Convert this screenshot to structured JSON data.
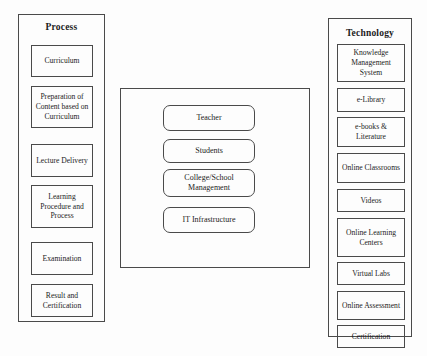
{
  "diagram": {
    "panels": [
      {
        "id": "process",
        "title": "Process",
        "items": [
          {
            "label": "Curriculum",
            "top": 44,
            "height": 32
          },
          {
            "label": "Preparation of Content based on Curriculum",
            "top": 85,
            "height": 42
          },
          {
            "label": "Lecture Delivery",
            "top": 143,
            "height": 33
          },
          {
            "label": "Learning Procedure and Process",
            "top": 184,
            "height": 43
          },
          {
            "label": "Examination",
            "top": 241,
            "height": 33
          },
          {
            "label": "Result and Certification",
            "top": 283,
            "height": 33
          }
        ]
      },
      {
        "id": "actors",
        "title": "",
        "items": [
          {
            "label": "Teacher",
            "top": 104,
            "height": 26
          },
          {
            "label": "College/School Management",
            "top": 168,
            "height": 28
          },
          {
            "label": "Students",
            "top": 138,
            "height": 24
          },
          {
            "label": "IT Infrastructure",
            "top": 206,
            "height": 26
          }
        ]
      },
      {
        "id": "technology",
        "title": "Technology",
        "items": [
          {
            "label": "Knowledge Management System",
            "top": 43,
            "height": 38
          },
          {
            "label": "e-Library",
            "top": 87,
            "height": 24
          },
          {
            "label": "e-books & Literature",
            "top": 116,
            "height": 30
          },
          {
            "label": "Online Classrooms",
            "top": 152,
            "height": 30
          },
          {
            "label": "Videos",
            "top": 188,
            "height": 23
          },
          {
            "label": "Online Learning Centers",
            "top": 217,
            "height": 39
          },
          {
            "label": "Virtual Labs",
            "top": 261,
            "height": 23
          },
          {
            "label": "Online Assessment",
            "top": 290,
            "height": 29
          },
          {
            "label": "Certification",
            "top": 324,
            "height": 23
          }
        ]
      }
    ]
  }
}
